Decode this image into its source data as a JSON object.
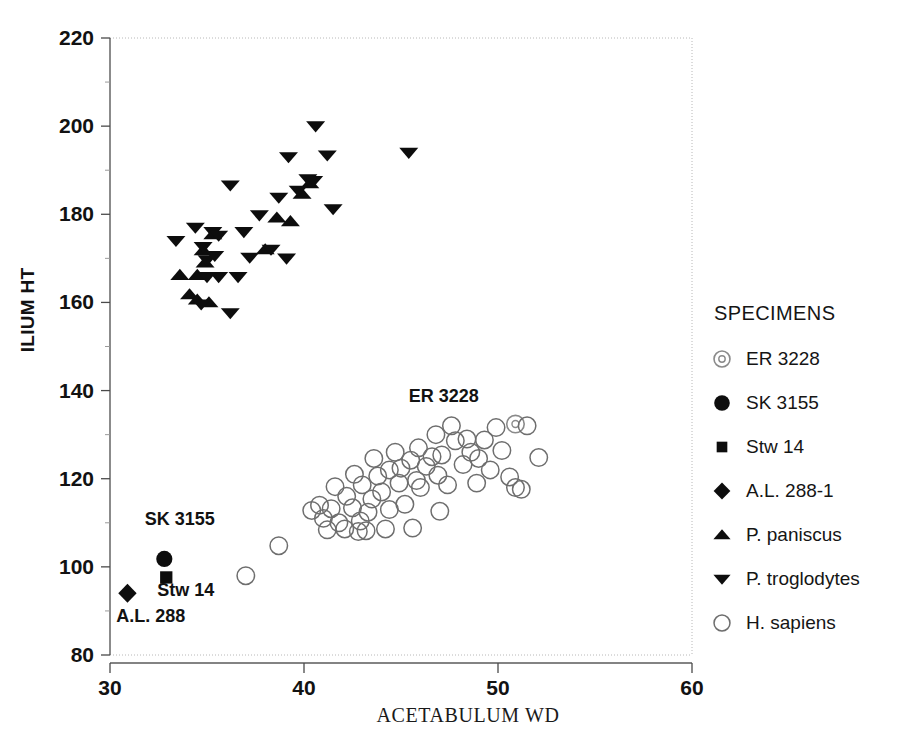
{
  "chart_data": {
    "type": "scatter",
    "title": "",
    "xlabel": "ACETABULUM WD",
    "ylabel": "ILIUM HT",
    "xlim": [
      30,
      60
    ],
    "ylim": [
      80,
      220
    ],
    "xticks": [
      30,
      40,
      50,
      60
    ],
    "yticks": [
      80,
      100,
      120,
      140,
      160,
      180,
      200,
      220
    ],
    "grid": false,
    "legend_position": "right",
    "legend_title": "SPECIMENS",
    "annotations": [
      {
        "text": "ER 3228",
        "x": 47.2,
        "y": 137.5
      },
      {
        "text": "SK 3155",
        "x": 33.6,
        "y": 109.5
      },
      {
        "text": "Stw 14",
        "x": 33.9,
        "y": 93.5
      },
      {
        "text": "A.L. 288",
        "x": 32.1,
        "y": 87.5
      }
    ],
    "series": [
      {
        "name": "ER 3228",
        "marker": "circle-dot",
        "filled": false,
        "points": [
          [
            50.9,
            132.4
          ]
        ]
      },
      {
        "name": "SK 3155",
        "marker": "circle",
        "filled": true,
        "points": [
          [
            32.8,
            101.8
          ]
        ]
      },
      {
        "name": "Stw 14",
        "marker": "square",
        "filled": true,
        "points": [
          [
            32.9,
            97.6
          ]
        ]
      },
      {
        "name": "A.L. 288-1",
        "marker": "diamond",
        "filled": true,
        "points": [
          [
            30.9,
            94.0
          ]
        ]
      },
      {
        "name": "P. paniscus",
        "marker": "triangle-up",
        "filled": true,
        "points": [
          [
            33.6,
            166.2
          ],
          [
            34.5,
            166.2
          ],
          [
            34.1,
            161.8
          ],
          [
            34.5,
            160.6
          ],
          [
            35.1,
            160.0
          ],
          [
            34.8,
            171.8
          ],
          [
            34.9,
            169.0
          ],
          [
            35.3,
            175.4
          ],
          [
            38.6,
            179.2
          ],
          [
            39.3,
            178.4
          ],
          [
            38.0,
            172.0
          ],
          [
            39.9,
            184.6
          ],
          [
            40.3,
            187.0
          ]
        ]
      },
      {
        "name": "P. troglodytes",
        "marker": "triangle-down",
        "filled": true,
        "points": [
          [
            33.4,
            174.0
          ],
          [
            34.4,
            177.0
          ],
          [
            34.8,
            172.6
          ],
          [
            35.0,
            169.6
          ],
          [
            35.3,
            176.0
          ],
          [
            35.6,
            175.2
          ],
          [
            35.4,
            170.6
          ],
          [
            35.6,
            165.8
          ],
          [
            35.0,
            165.8
          ],
          [
            36.6,
            165.8
          ],
          [
            36.2,
            157.6
          ],
          [
            34.7,
            159.6
          ],
          [
            37.2,
            170.2
          ],
          [
            36.9,
            176.0
          ],
          [
            36.2,
            186.6
          ],
          [
            37.7,
            179.8
          ],
          [
            38.3,
            172.0
          ],
          [
            39.1,
            170.0
          ],
          [
            39.7,
            185.4
          ],
          [
            40.2,
            188.0
          ],
          [
            40.5,
            187.6
          ],
          [
            40.6,
            200.0
          ],
          [
            41.2,
            193.4
          ],
          [
            41.5,
            181.2
          ],
          [
            39.2,
            193.0
          ],
          [
            38.7,
            183.8
          ],
          [
            45.4,
            194.0
          ]
        ]
      },
      {
        "name": "H. sapiens",
        "marker": "circle",
        "filled": false,
        "points": [
          [
            37.0,
            98.0
          ],
          [
            38.7,
            104.8
          ],
          [
            41.4,
            113.2
          ],
          [
            41.0,
            111.0
          ],
          [
            41.8,
            110.0
          ],
          [
            42.2,
            116.0
          ],
          [
            42.5,
            113.4
          ],
          [
            42.1,
            108.6
          ],
          [
            42.8,
            108.0
          ],
          [
            43.3,
            112.4
          ],
          [
            43.5,
            115.4
          ],
          [
            43.0,
            118.6
          ],
          [
            43.8,
            120.6
          ],
          [
            44.0,
            117.0
          ],
          [
            44.4,
            113.0
          ],
          [
            44.2,
            108.6
          ],
          [
            44.9,
            119.0
          ],
          [
            45.2,
            114.2
          ],
          [
            45.0,
            122.4
          ],
          [
            45.5,
            124.2
          ],
          [
            45.8,
            119.6
          ],
          [
            45.6,
            108.8
          ],
          [
            46.3,
            122.8
          ],
          [
            46.0,
            118.0
          ],
          [
            46.6,
            125.0
          ],
          [
            46.9,
            120.8
          ],
          [
            47.1,
            125.4
          ],
          [
            47.4,
            118.6
          ],
          [
            47.0,
            112.6
          ],
          [
            47.8,
            128.6
          ],
          [
            48.2,
            123.2
          ],
          [
            48.6,
            126.0
          ],
          [
            48.4,
            129.0
          ],
          [
            49.0,
            124.6
          ],
          [
            49.3,
            128.8
          ],
          [
            49.6,
            122.0
          ],
          [
            49.9,
            131.6
          ],
          [
            50.2,
            126.4
          ],
          [
            50.6,
            120.4
          ],
          [
            50.9,
            118.0
          ],
          [
            51.2,
            117.6
          ],
          [
            51.5,
            132.0
          ],
          [
            52.1,
            124.8
          ],
          [
            40.4,
            112.8
          ],
          [
            40.8,
            114.0
          ],
          [
            41.6,
            118.2
          ],
          [
            42.6,
            121.0
          ],
          [
            43.6,
            124.6
          ],
          [
            44.7,
            126.0
          ],
          [
            45.9,
            127.0
          ],
          [
            46.8,
            130.0
          ],
          [
            47.6,
            132.0
          ],
          [
            48.9,
            119.0
          ],
          [
            44.4,
            122.0
          ],
          [
            42.9,
            110.4
          ],
          [
            41.2,
            108.4
          ],
          [
            43.2,
            108.2
          ]
        ]
      }
    ]
  },
  "legend": {
    "title": "SPECIMENS",
    "items": [
      {
        "label": "ER 3228",
        "marker": "circle-dot"
      },
      {
        "label": "SK 3155",
        "marker": "circle-filled"
      },
      {
        "label": "Stw 14",
        "marker": "square-filled"
      },
      {
        "label": "A.L. 288-1",
        "marker": "diamond-filled"
      },
      {
        "label": "P. paniscus",
        "marker": "triangle-up-filled"
      },
      {
        "label": "P. troglodytes",
        "marker": "triangle-down-filled"
      },
      {
        "label": "H. sapiens",
        "marker": "circle-open"
      }
    ]
  },
  "colors": {
    "marker_filled": "#0d0d0d",
    "marker_open_stroke": "#6e6e6e",
    "axis": "#5a5a5a",
    "text": "#151515",
    "background": "#ffffff"
  }
}
